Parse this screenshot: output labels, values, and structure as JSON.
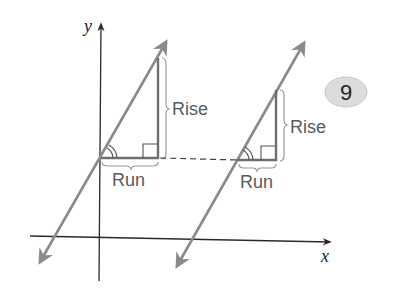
{
  "diagram": {
    "axes": {
      "x_label": "x",
      "y_label": "y"
    },
    "triangles": [
      {
        "rise_label": "Rise",
        "run_label": "Run"
      },
      {
        "rise_label": "Rise",
        "run_label": "Run"
      }
    ],
    "badge": {
      "number": "9"
    },
    "colors": {
      "axis": "#2a2a2a",
      "line": "#8a8a8a",
      "triangle": "#6e6e6e",
      "brace": "#9a9a9a",
      "label": "#5a5a5a",
      "badge_fill": "#dcdcdc"
    }
  }
}
